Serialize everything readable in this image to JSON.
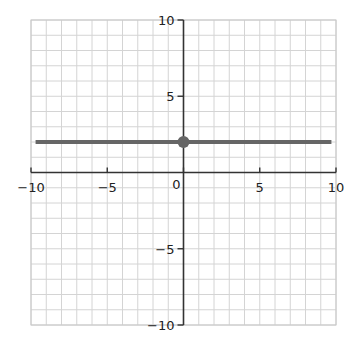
{
  "chart_data": {
    "type": "line",
    "title": "",
    "xlabel": "",
    "ylabel": "",
    "xlim": [
      -10,
      10
    ],
    "ylim": [
      -10,
      10
    ],
    "grid": true,
    "grid_step": 1,
    "x_ticks": [
      -10,
      -5,
      0,
      5,
      10
    ],
    "y_ticks": [
      -10,
      -5,
      5,
      10
    ],
    "x_tick_labels": [
      "−10",
      "−5",
      "0",
      "5",
      "10"
    ],
    "y_tick_labels": [
      "−10",
      "−5",
      "5",
      "10"
    ],
    "origin_label": "0",
    "series": [
      {
        "name": "horizontal line y = 2",
        "x": [
          -9.7,
          9.7
        ],
        "y": [
          2,
          2
        ],
        "color": "#666666"
      }
    ],
    "points": [
      {
        "x": 0,
        "y": 2,
        "color": "#666666"
      }
    ],
    "legend": null
  },
  "colors": {
    "grid": "#d4d4d4",
    "axis": "#333333",
    "line": "#666666",
    "frame": "#c8c8c8"
  }
}
